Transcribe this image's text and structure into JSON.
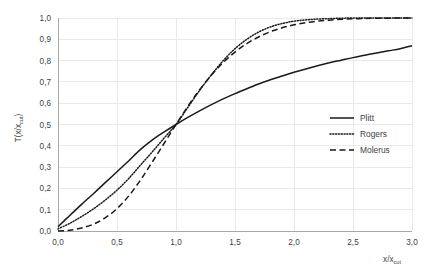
{
  "chart_data": {
    "type": "line",
    "title": "",
    "subtitle": "",
    "xlabel": "x/x_cut",
    "ylabel": "T(x/x_cut)",
    "xlabel_main": "x/x",
    "xlabel_sub": "cut",
    "ylabel_main": "T(x/x",
    "ylabel_sub": "cut",
    "ylabel_tail": ")",
    "xlim": [
      0.0,
      3.0
    ],
    "ylim": [
      0.0,
      1.0
    ],
    "grid": true,
    "legend_position": "center-right",
    "xticks": [
      0.0,
      0.5,
      1.0,
      1.5,
      2.0,
      2.5,
      3.0
    ],
    "xtick_labels": [
      "0,0",
      "0,5",
      "1,0",
      "1,5",
      "2,0",
      "2,5",
      "3,0"
    ],
    "yticks": [
      0.0,
      0.1,
      0.2,
      0.3,
      0.4,
      0.5,
      0.6,
      0.7,
      0.8,
      0.9,
      1.0
    ],
    "ytick_labels": [
      "0,0",
      "0,1",
      "0,2",
      "0,3",
      "0,4",
      "0,5",
      "0,6",
      "0,7",
      "0,8",
      "0,9",
      "1,0"
    ],
    "x": [
      0.0,
      0.1,
      0.2,
      0.3,
      0.4,
      0.5,
      0.6,
      0.7,
      0.8,
      0.9,
      1.0,
      1.1,
      1.2,
      1.3,
      1.4,
      1.5,
      1.6,
      1.7,
      1.8,
      1.9,
      2.0,
      2.1,
      2.2,
      2.3,
      2.4,
      2.5,
      2.6,
      2.7,
      2.8,
      2.9,
      3.0
    ],
    "series": [
      {
        "name": "Plitt",
        "style": "solid",
        "color": "#1a1a1a",
        "values": [
          0.02,
          0.073,
          0.125,
          0.175,
          0.227,
          0.278,
          0.33,
          0.383,
          0.428,
          0.465,
          0.5,
          0.533,
          0.564,
          0.593,
          0.62,
          0.645,
          0.668,
          0.69,
          0.71,
          0.728,
          0.745,
          0.761,
          0.776,
          0.79,
          0.802,
          0.814,
          0.825,
          0.836,
          0.846,
          0.856,
          0.87
        ]
      },
      {
        "name": "Rogers",
        "style": "dotted",
        "color": "#1a1a1a",
        "values": [
          0.01,
          0.036,
          0.068,
          0.104,
          0.145,
          0.192,
          0.247,
          0.31,
          0.372,
          0.437,
          0.5,
          0.58,
          0.66,
          0.733,
          0.8,
          0.856,
          0.9,
          0.934,
          0.958,
          0.974,
          0.985,
          0.991,
          0.995,
          0.997,
          0.999,
          1.0,
          1.0,
          1.0,
          1.0,
          1.0,
          1.0
        ]
      },
      {
        "name": "Molerus",
        "style": "dashed",
        "color": "#1a1a1a",
        "values": [
          0.0,
          0.004,
          0.014,
          0.032,
          0.062,
          0.105,
          0.165,
          0.24,
          0.325,
          0.412,
          0.5,
          0.585,
          0.663,
          0.732,
          0.791,
          0.84,
          0.88,
          0.911,
          0.936,
          0.954,
          0.968,
          0.978,
          0.985,
          0.99,
          0.994,
          0.996,
          0.998,
          0.999,
          0.999,
          1.0,
          1.0
        ]
      }
    ],
    "legend_entries": [
      {
        "label": "Plitt",
        "style": "solid"
      },
      {
        "label": "Rogers",
        "style": "dotted"
      },
      {
        "label": "Molerus",
        "style": "dashed"
      }
    ]
  }
}
